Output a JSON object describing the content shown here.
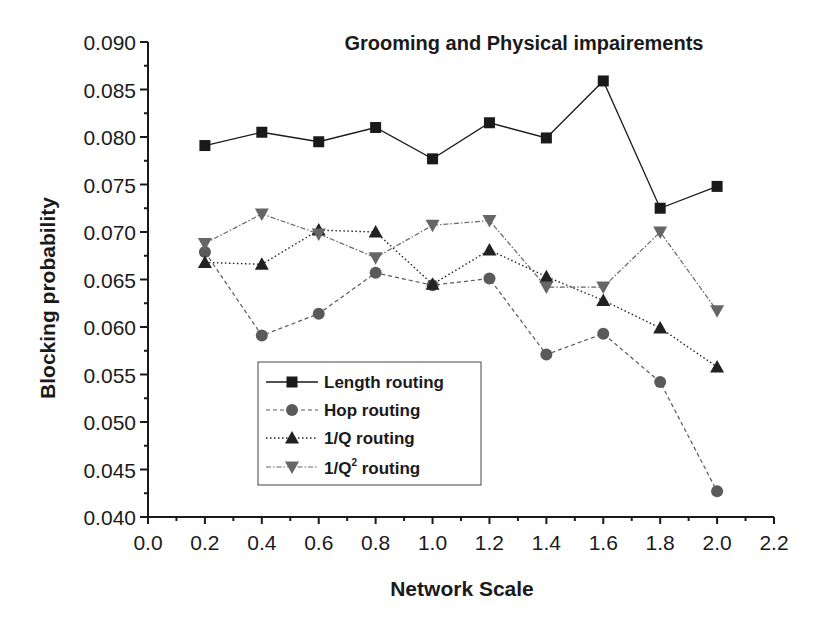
{
  "chart_data": {
    "type": "line",
    "title": "Grooming and Physical impairements",
    "xlabel": "Network Scale",
    "ylabel": "Blocking probability",
    "xlim": [
      0.0,
      2.2
    ],
    "ylim": [
      0.04,
      0.09
    ],
    "x_ticks": [
      "0.0",
      "0.2",
      "0.4",
      "0.6",
      "0.8",
      "1.0",
      "1.2",
      "1.4",
      "1.6",
      "1.8",
      "2.0",
      "2.2"
    ],
    "y_ticks": [
      "0.040",
      "0.045",
      "0.050",
      "0.055",
      "0.060",
      "0.065",
      "0.070",
      "0.075",
      "0.080",
      "0.085",
      "0.090"
    ],
    "grid": false,
    "legend_position": "lower-left inside",
    "x": [
      0.2,
      0.4,
      0.6,
      0.8,
      1.0,
      1.2,
      1.4,
      1.6,
      1.8,
      2.0
    ],
    "series": [
      {
        "name": "Length routing",
        "marker": "square",
        "line": "solid",
        "color": "#1a1a1a",
        "values": [
          0.0791,
          0.0805,
          0.0795,
          0.081,
          0.0777,
          0.0815,
          0.0799,
          0.0859,
          0.0725,
          0.0748
        ]
      },
      {
        "name": "Hop routing",
        "marker": "circle",
        "line": "dashed",
        "color": "#5a5a5a",
        "values": [
          0.0679,
          0.0591,
          0.0614,
          0.0657,
          0.0644,
          0.0651,
          0.0571,
          0.0593,
          0.0542,
          0.0427
        ]
      },
      {
        "name": "1/Q routing",
        "marker": "triangle-up",
        "line": "dotted",
        "color": "#222222",
        "values": [
          0.0668,
          0.0666,
          0.0702,
          0.07,
          0.0645,
          0.0681,
          0.0653,
          0.0628,
          0.0599,
          0.0558
        ]
      },
      {
        "name": "1/Q² routing",
        "marker": "triangle-down",
        "line": "dash-dot",
        "color": "#666666",
        "values": [
          0.0688,
          0.0719,
          0.0698,
          0.0673,
          0.0707,
          0.0712,
          0.0642,
          0.0642,
          0.07,
          0.0617
        ]
      }
    ]
  },
  "legend": {
    "items": [
      {
        "label": "Length routing"
      },
      {
        "label": "Hop routing"
      },
      {
        "label": "1/Q routing"
      },
      {
        "label_prefix": "1/Q",
        "label_sup": "2",
        "label_suffix": " routing"
      }
    ]
  }
}
